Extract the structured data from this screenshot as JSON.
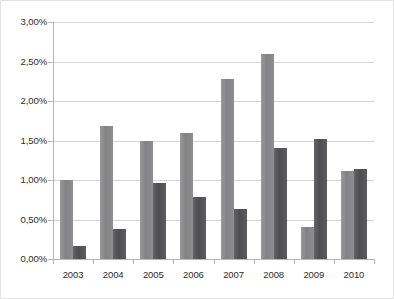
{
  "chart_data": {
    "type": "bar",
    "title": "",
    "subtitle": "",
    "xlabel": "",
    "ylabel": "",
    "categories": [
      "2003",
      "2004",
      "2005",
      "2006",
      "2007",
      "2008",
      "2009",
      "2010"
    ],
    "series": [
      {
        "name": "series-a",
        "color": "#8a8a8c",
        "values": [
          1.0,
          1.69,
          1.5,
          1.59,
          2.28,
          2.59,
          0.4,
          1.11
        ]
      },
      {
        "name": "series-b",
        "color": "#58585a",
        "values": [
          0.17,
          0.38,
          0.96,
          0.79,
          0.63,
          1.4,
          1.52,
          1.14
        ]
      }
    ],
    "ylim": [
      0,
      3.0
    ],
    "ytick_values": [
      0.0,
      0.5,
      1.0,
      1.5,
      2.0,
      2.5,
      3.0
    ],
    "ytick_labels": [
      "0,00%",
      "0,50%",
      "1,00%",
      "1,50%",
      "2,00%",
      "2,50%",
      "3,00%"
    ],
    "grid": true,
    "legend": "none",
    "axis_color": "#b6b6b6",
    "grid_color": "#d5d5d5",
    "background": "#ffffff"
  }
}
